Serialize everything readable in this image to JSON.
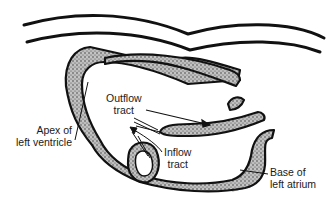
{
  "diagram": {
    "colors": {
      "line": "#111111",
      "tissue_fill": "#c9c9c9",
      "background": "#ffffff"
    },
    "labels": {
      "outflow": {
        "line1": "Outflow",
        "line2": "tract"
      },
      "inflow": {
        "line1": "Inflow",
        "line2": "tract"
      },
      "apex": {
        "line1": "Apex of",
        "line2": "left ventricle"
      },
      "base": {
        "line1": "Base of",
        "line2": "left atrium"
      }
    },
    "arrows": [
      {
        "name": "outflow-arrow",
        "direction": "down-right"
      },
      {
        "name": "inflow-arrow",
        "direction": "up-left"
      }
    ]
  }
}
